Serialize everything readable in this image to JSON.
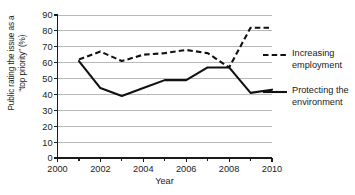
{
  "chart_data": {
    "type": "line",
    "title": "",
    "xlabel": "Year",
    "ylabel": "Public rating the issue as a \"top priority\" (%)",
    "ylabel_line1": "Public rating the issue as a",
    "ylabel_line2": "“top priority” (%)",
    "x": [
      2001,
      2002,
      2003,
      2004,
      2005,
      2006,
      2007,
      2008,
      2009,
      2010
    ],
    "xlim": [
      2000,
      2010
    ],
    "ylim": [
      0,
      90
    ],
    "xticks": [
      2000,
      2002,
      2004,
      2006,
      2008,
      2010
    ],
    "xtick_labels": [
      "2000",
      "2002",
      "2004",
      "2006",
      "2008",
      "2010"
    ],
    "yticks": [
      0,
      10,
      20,
      30,
      40,
      50,
      60,
      70,
      80,
      90
    ],
    "ytick_labels": [
      "0",
      "10",
      "20",
      "30",
      "40",
      "50",
      "60",
      "70",
      "80",
      "90"
    ],
    "grid": true,
    "grid_axis": "y",
    "legend_position": "right",
    "series": [
      {
        "name": "Increasing employment",
        "name_line1": "Increasing",
        "name_line2": "employment",
        "style": "dashed",
        "color": "#111111",
        "values": [
          62,
          67,
          61,
          65,
          66,
          68,
          66,
          57,
          82,
          82
        ]
      },
      {
        "name": "Protecting the environment",
        "name_line1": "Protecting the",
        "name_line2": "environment",
        "style": "solid",
        "color": "#111111",
        "values": [
          61,
          44,
          39,
          44,
          49,
          49,
          57,
          57,
          41,
          43
        ]
      }
    ]
  },
  "legend": {
    "items": [
      {
        "label_line1": "Increasing",
        "label_line2": "employment",
        "style": "dashed"
      },
      {
        "label_line1": "Protecting the",
        "label_line2": "environment",
        "style": "solid"
      }
    ]
  }
}
